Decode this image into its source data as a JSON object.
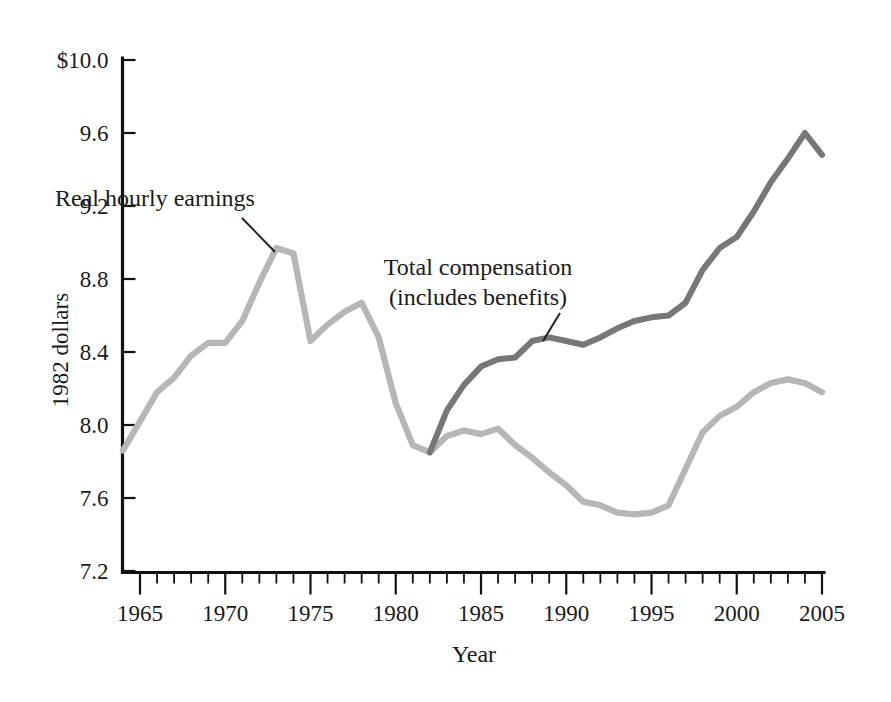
{
  "chart_data": {
    "type": "line",
    "title": "",
    "xlabel": "Year",
    "ylabel": "1982 dollars",
    "xlim": [
      1964,
      2005
    ],
    "ylim": [
      7.2,
      10.0
    ],
    "grid": false,
    "legend_position": "inline-annotations",
    "y_ticks": [
      "$10.0",
      "9.6",
      "9.2",
      "8.8",
      "8.4",
      "8.0",
      "7.6",
      "7.2"
    ],
    "y_tick_values": [
      10.0,
      9.6,
      9.2,
      8.8,
      8.4,
      8.0,
      7.6,
      7.2
    ],
    "x_ticks": [
      "1965",
      "1970",
      "1975",
      "1980",
      "1985",
      "1990",
      "1995",
      "2000",
      "2005"
    ],
    "x_tick_values": [
      1965,
      1970,
      1975,
      1980,
      1985,
      1990,
      1995,
      2000,
      2005
    ],
    "x_minor_step": 1,
    "series": [
      {
        "name": "Real hourly earnings",
        "color": "#b6b6b6",
        "x": [
          1964,
          1965,
          1966,
          1967,
          1968,
          1969,
          1970,
          1971,
          1972,
          1973,
          1974,
          1975,
          1976,
          1977,
          1978,
          1979,
          1980,
          1981,
          1982,
          1983,
          1984,
          1985,
          1986,
          1987,
          1988,
          1989,
          1990,
          1991,
          1992,
          1993,
          1994,
          1995,
          1996,
          1997,
          1998,
          1999,
          2000,
          2001,
          2002,
          2003,
          2004,
          2005
        ],
        "values": [
          7.86,
          8.02,
          8.18,
          8.26,
          8.38,
          8.45,
          8.45,
          8.57,
          8.78,
          8.97,
          8.94,
          8.46,
          8.55,
          8.62,
          8.67,
          8.48,
          8.12,
          7.89,
          7.85,
          7.94,
          7.97,
          7.95,
          7.98,
          7.89,
          7.82,
          7.74,
          7.67,
          7.58,
          7.56,
          7.52,
          7.51,
          7.52,
          7.56,
          7.76,
          7.96,
          8.05,
          8.1,
          8.18,
          8.23,
          8.25,
          8.23,
          8.18
        ]
      },
      {
        "name": "Total compensation (includes benefits)",
        "color": "#777777",
        "x": [
          1982,
          1983,
          1984,
          1985,
          1986,
          1987,
          1988,
          1989,
          1990,
          1991,
          1992,
          1993,
          1994,
          1995,
          1996,
          1997,
          1998,
          1999,
          2000,
          2001,
          2002,
          2003,
          2004,
          2005
        ],
        "values": [
          7.85,
          8.08,
          8.22,
          8.32,
          8.36,
          8.37,
          8.46,
          8.48,
          8.46,
          8.44,
          8.48,
          8.53,
          8.57,
          8.59,
          8.6,
          8.67,
          8.85,
          8.97,
          9.03,
          9.17,
          9.33,
          9.46,
          9.6,
          9.48
        ]
      }
    ],
    "annotations": [
      {
        "id": "real-hourly-earnings",
        "lines": [
          "Real hourly earnings"
        ],
        "text_x": 155,
        "text_y": 206,
        "leader": {
          "x1": 242,
          "y1": 218,
          "x2": 275,
          "y2": 252
        }
      },
      {
        "id": "total-compensation",
        "lines": [
          "Total compensation",
          "(includes benefits)"
        ],
        "text_x": 478,
        "text_y": 275,
        "leader": {
          "x1": 560,
          "y1": 313,
          "x2": 543,
          "y2": 341
        }
      }
    ]
  }
}
